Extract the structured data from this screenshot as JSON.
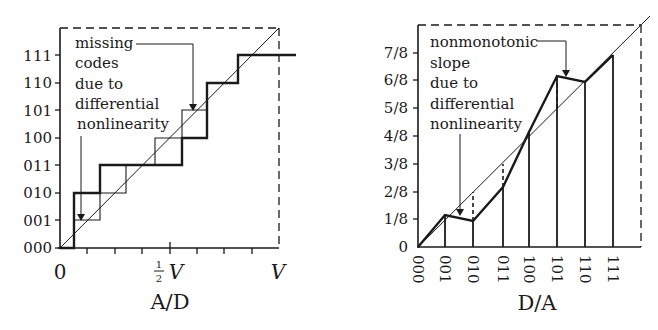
{
  "ad_plot": {
    "title": "A/D",
    "y_ticks": [
      "000",
      "001",
      "010",
      "011",
      "100",
      "101",
      "110",
      "111"
    ],
    "x_labels": {
      "zero": "0",
      "half_num": "1",
      "half_den": "2",
      "half_v": "V",
      "full": "V"
    },
    "annotation": [
      "missing",
      "codes",
      "due to",
      "differential",
      "nonlinearity"
    ]
  },
  "da_plot": {
    "title": "D/A",
    "y_ticks": [
      "0",
      "1/8",
      "2/8",
      "3/8",
      "4/8",
      "5/8",
      "6/8",
      "7/8"
    ],
    "x_ticks": [
      "000",
      "001",
      "010",
      "011",
      "100",
      "101",
      "110",
      "111"
    ],
    "annotation": [
      "nonmonotonic",
      "slope",
      "due to",
      "differential",
      "nonlinearity"
    ]
  },
  "colors": {
    "ink": "#1a1a1a",
    "background": "#ffffff"
  }
}
